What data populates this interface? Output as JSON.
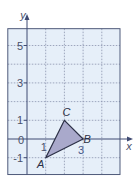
{
  "diagram": {
    "type": "coordinate-grid",
    "axes": {
      "x_label": "x",
      "y_label": "y",
      "x_range": [
        -1,
        5
      ],
      "y_range": [
        -1.9,
        5.9
      ],
      "origin_label": "0",
      "x_ticks": [
        {
          "value": 1,
          "label": "1"
        },
        {
          "value": 3,
          "label": "3"
        }
      ],
      "y_ticks": [
        {
          "value": 5,
          "label": "5"
        },
        {
          "value": 3,
          "label": "3"
        },
        {
          "value": 1,
          "label": "1"
        },
        {
          "value": -1,
          "label": "-1"
        }
      ],
      "grid_step": 1
    },
    "triangle": {
      "vertices": [
        {
          "name": "A",
          "x": 1,
          "y": -1
        },
        {
          "name": "B",
          "x": 3,
          "y": 0
        },
        {
          "name": "C",
          "x": 2,
          "y": 1
        }
      ]
    },
    "colors": {
      "grid_background": "#e6eff9",
      "grid_border": "#4f5a7a",
      "grid_lines": "#8a93ad",
      "axis": "#3f4a72",
      "triangle_fill": "#a9a9cb",
      "triangle_stroke": "#2b2f45"
    }
  }
}
